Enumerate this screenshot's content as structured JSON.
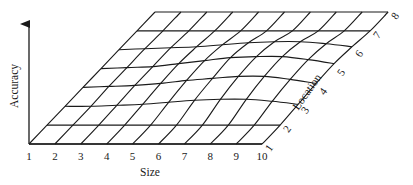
{
  "figure": {
    "y_axis_label": "Accuracy",
    "x_axis_label": "Size",
    "z_axis_label": "Location",
    "x_ticks": [
      "1",
      "2",
      "3",
      "4",
      "5",
      "6",
      "7",
      "8",
      "9",
      "10"
    ],
    "z_ticks": [
      "1",
      "2",
      "3",
      "4",
      "5",
      "6",
      "7",
      "8"
    ]
  },
  "chart_data": {
    "type": "surface",
    "title": "",
    "xlabel": "Size",
    "ylabel": "Accuracy",
    "zlabel": "Location",
    "x": [
      1,
      2,
      3,
      4,
      5,
      6,
      7,
      8,
      9,
      10
    ],
    "location": [
      1,
      2,
      3,
      4,
      5,
      6,
      7,
      8
    ],
    "grid": "wireframe",
    "accuracy_grid": [
      [
        0,
        0,
        0,
        0,
        0,
        0,
        0,
        0,
        0,
        0
      ],
      [
        0,
        0,
        0,
        0,
        0,
        0,
        0,
        0,
        0,
        0
      ],
      [
        0,
        0,
        1,
        2,
        4,
        6,
        7,
        7,
        5,
        2
      ],
      [
        0,
        1,
        2,
        4,
        7,
        9,
        11,
        11,
        8,
        4
      ],
      [
        0,
        1,
        2,
        5,
        8,
        11,
        12,
        12,
        9,
        5
      ],
      [
        0,
        1,
        2,
        3,
        5,
        7,
        8,
        8,
        6,
        3
      ],
      [
        0,
        0,
        0,
        0,
        0,
        0,
        0,
        0,
        0,
        0
      ],
      [
        0,
        0,
        0,
        0,
        0,
        0,
        0,
        0,
        0,
        0
      ]
    ],
    "axis_ranges": {
      "size": [
        1,
        10
      ],
      "location": [
        1,
        8
      ]
    }
  },
  "geometry": {
    "origin_x": 29,
    "origin_y": 144,
    "size_step_x": 25.9,
    "loc_step_x": 14.0,
    "loc_step_y": 18.86,
    "height_scale": 1.0
  }
}
